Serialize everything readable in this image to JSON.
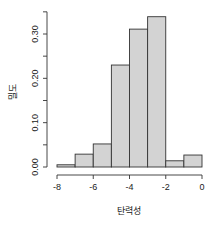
{
  "chart_data": {
    "type": "bar",
    "subtype": "histogram",
    "title": "",
    "xlabel": "탄력성",
    "ylabel": "밀도",
    "bin_edges": [
      -8,
      -7,
      -6,
      -5,
      -4,
      -3,
      -2,
      -1,
      0
    ],
    "categories": [
      "[-8,-7)",
      "[-7,-6)",
      "[-6,-5)",
      "[-5,-4)",
      "[-4,-3)",
      "[-3,-2)",
      "[-2,-1)",
      "[-1,0]"
    ],
    "values": [
      0.005,
      0.029,
      0.052,
      0.23,
      0.311,
      0.339,
      0.014,
      0.027
    ],
    "xlim": [
      -8,
      0
    ],
    "ylim": [
      0,
      0.35
    ],
    "x_ticks": [
      -8,
      -6,
      -4,
      -2,
      0
    ],
    "x_tick_labels": [
      "-8",
      "-6",
      "-4",
      "-2",
      "0"
    ],
    "y_ticks": [
      0,
      0.05,
      0.1,
      0.15,
      0.2,
      0.25,
      0.3,
      0.35
    ],
    "y_tick_labels": [
      "0.00",
      "0.10",
      "0.20",
      "0.30"
    ],
    "y_labeled_ticks": [
      0,
      0.1,
      0.2,
      0.3
    ],
    "grid": false,
    "legend": null,
    "colors": {
      "bar_fill": "#d3d3d3",
      "bar_stroke": "#333333",
      "axis": "#333333"
    }
  }
}
